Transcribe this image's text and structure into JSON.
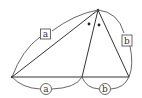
{
  "diagram": {
    "title": "",
    "vertices": {
      "apex": {
        "x": 98,
        "y": 10
      },
      "left": {
        "x": 12,
        "y": 77
      },
      "right": {
        "x": 129,
        "y": 77
      },
      "bisector_foot": {
        "x": 82,
        "y": 77
      }
    },
    "side_labels": {
      "left_side": "a",
      "right_side": "b"
    },
    "base_labels": {
      "left_segment": "a",
      "right_segment": "b"
    },
    "angle_marks": [
      "•",
      "•"
    ],
    "colors": {
      "line": "#333333",
      "background": "#ffffff"
    }
  }
}
